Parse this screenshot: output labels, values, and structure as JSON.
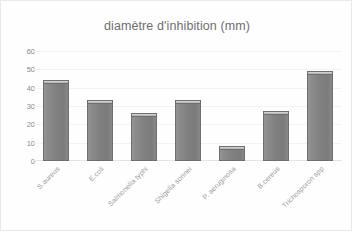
{
  "chart_data": {
    "type": "bar",
    "title": "diamètre d'inhibition (mm)",
    "xlabel": "",
    "ylabel": "",
    "ylim": [
      0,
      60
    ],
    "yticks": [
      60,
      50,
      40,
      30,
      20,
      10,
      0
    ],
    "grid": true,
    "legend": null,
    "categories": [
      "S.aureus",
      "E.coli",
      "Salmonella typhi",
      "Shigella sonnei",
      "P. aeruginosa",
      "B.cereus",
      "Trichosporon spp"
    ],
    "values": [
      42,
      31,
      24,
      31,
      6,
      25,
      47
    ],
    "series": [
      {
        "name": "diamètre d'inhibition (mm)",
        "values": [
          42,
          31,
          24,
          31,
          6,
          25,
          47
        ]
      }
    ],
    "colors": {
      "bar_fill": "#818181",
      "bar_border": "#6f6f6f",
      "bar_cap": "#c2c2c2",
      "title_text": "#6e6e6e",
      "tick_text": "#8a8a8a",
      "label_text": "#9b9b9b",
      "gridline": "#f2f2f2",
      "background": "#fefefe",
      "frame_border": "#e9e9e9"
    }
  }
}
